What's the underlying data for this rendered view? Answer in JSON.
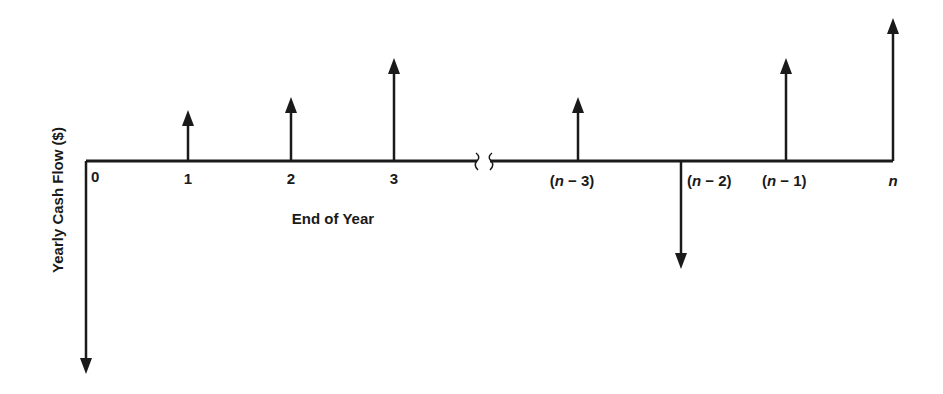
{
  "diagram": {
    "type": "cash-flow-diagram",
    "y_axis_label": "Yearly Cash Flow ($)",
    "x_axis_label": "End of Year",
    "line_color": "#1a1a1a",
    "axis_break": true,
    "ticks": [
      {
        "id": "t0",
        "label": "0",
        "italic": false
      },
      {
        "id": "t1",
        "label": "1",
        "italic": false
      },
      {
        "id": "t2",
        "label": "2",
        "italic": false
      },
      {
        "id": "t3",
        "label": "3",
        "italic": false
      },
      {
        "id": "tn3",
        "label": "(n − 3)",
        "italic": true
      },
      {
        "id": "tn2",
        "label": "(n − 2)",
        "italic": true
      },
      {
        "id": "tn1",
        "label": "(n − 1)",
        "italic": true
      },
      {
        "id": "tn",
        "label": "n",
        "italic": true
      }
    ],
    "cash_flows": [
      {
        "period": "0",
        "direction": "down",
        "relative_magnitude": 212
      },
      {
        "period": "1",
        "direction": "up",
        "relative_magnitude": 51
      },
      {
        "period": "2",
        "direction": "up",
        "relative_magnitude": 64
      },
      {
        "period": "3",
        "direction": "up",
        "relative_magnitude": 103
      },
      {
        "period": "n-3",
        "direction": "up",
        "relative_magnitude": 64
      },
      {
        "period": "n-2",
        "direction": "down",
        "relative_magnitude": 107
      },
      {
        "period": "n-1",
        "direction": "up",
        "relative_magnitude": 103
      },
      {
        "period": "n",
        "direction": "up",
        "relative_magnitude": 143
      }
    ]
  }
}
